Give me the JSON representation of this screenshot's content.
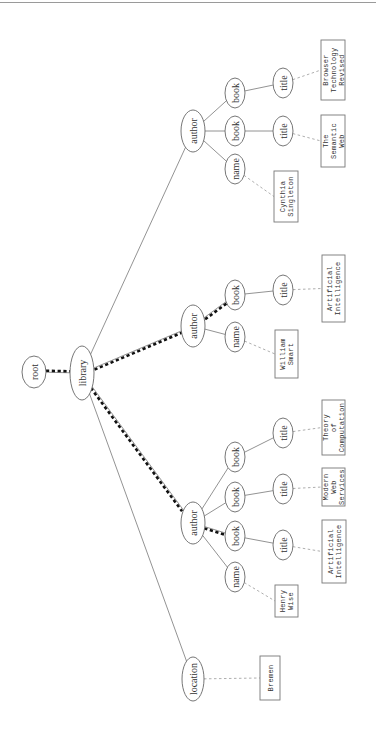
{
  "diagram": {
    "type": "xml-tree",
    "orientation": "rotated-90",
    "highlight_color": "#111111",
    "edge_color": "#777777",
    "leaf_edge_color": "#999999",
    "nodes": [
      {
        "id": "root",
        "label": "root",
        "cx": 34,
        "cy": 372,
        "rx": 12,
        "ry": 16
      },
      {
        "id": "library",
        "label": "library",
        "cx": 82,
        "cy": 373,
        "rx": 12,
        "ry": 27
      },
      {
        "id": "author3",
        "label": "author",
        "cx": 193,
        "cy": 131,
        "rx": 12,
        "ry": 21
      },
      {
        "id": "author3-name",
        "label": "name",
        "cx": 235,
        "cy": 169,
        "rx": 10,
        "ry": 15
      },
      {
        "id": "author3-book1",
        "label": "book",
        "cx": 235,
        "cy": 131,
        "rx": 10,
        "ry": 15
      },
      {
        "id": "author3-book2",
        "label": "book",
        "cx": 235,
        "cy": 93,
        "rx": 10,
        "ry": 15
      },
      {
        "id": "author3-book1-title",
        "label": "title",
        "cx": 283,
        "cy": 131,
        "rx": 10,
        "ry": 15
      },
      {
        "id": "author3-book2-title",
        "label": "title",
        "cx": 283,
        "cy": 83,
        "rx": 10,
        "ry": 15
      },
      {
        "id": "author2",
        "label": "author",
        "cx": 193,
        "cy": 326,
        "rx": 12,
        "ry": 21
      },
      {
        "id": "author2-name",
        "label": "name",
        "cx": 235,
        "cy": 337,
        "rx": 10,
        "ry": 15
      },
      {
        "id": "author2-book1",
        "label": "book",
        "cx": 235,
        "cy": 295,
        "rx": 10,
        "ry": 15
      },
      {
        "id": "author2-book1-title",
        "label": "title",
        "cx": 283,
        "cy": 290,
        "rx": 10,
        "ry": 15
      },
      {
        "id": "author1",
        "label": "author",
        "cx": 193,
        "cy": 523,
        "rx": 12,
        "ry": 21
      },
      {
        "id": "author1-name",
        "label": "name",
        "cx": 235,
        "cy": 577,
        "rx": 10,
        "ry": 15
      },
      {
        "id": "author1-book1",
        "label": "book",
        "cx": 235,
        "cy": 536,
        "rx": 10,
        "ry": 15
      },
      {
        "id": "author1-book2",
        "label": "book",
        "cx": 235,
        "cy": 497,
        "rx": 10,
        "ry": 15
      },
      {
        "id": "author1-book3",
        "label": "book",
        "cx": 235,
        "cy": 457,
        "rx": 10,
        "ry": 15
      },
      {
        "id": "author1-book1-title",
        "label": "title",
        "cx": 283,
        "cy": 545,
        "rx": 10,
        "ry": 15
      },
      {
        "id": "author1-book2-title",
        "label": "title",
        "cx": 283,
        "cy": 489,
        "rx": 10,
        "ry": 15
      },
      {
        "id": "author1-book3-title",
        "label": "title",
        "cx": 283,
        "cy": 433,
        "rx": 10,
        "ry": 15
      },
      {
        "id": "location",
        "label": "location",
        "cx": 193,
        "cy": 679,
        "rx": 11,
        "ry": 22
      }
    ],
    "leaves": [
      {
        "id": "leaf-browser",
        "lines": [
          "Browser",
          "Technology",
          "Revised"
        ],
        "x": 321,
        "y": 40,
        "w": 24,
        "h": 60,
        "parent": "author3-book2-title"
      },
      {
        "id": "leaf-semantic",
        "lines": [
          "The",
          "Semantic",
          "Web"
        ],
        "x": 321,
        "y": 115,
        "w": 24,
        "h": 52,
        "parent": "author3-book1-title"
      },
      {
        "id": "leaf-cynthia",
        "lines": [
          "Cynthia",
          "Singleton"
        ],
        "x": 274,
        "y": 171,
        "w": 24,
        "h": 51,
        "parent": "author3-name"
      },
      {
        "id": "leaf-ai2",
        "lines": [
          "Artificial",
          "Intelligence"
        ],
        "x": 322,
        "y": 255,
        "w": 23,
        "h": 67,
        "parent": "author2-book1-title"
      },
      {
        "id": "leaf-william",
        "lines": [
          "William",
          "Smart"
        ],
        "x": 275,
        "y": 330,
        "w": 23,
        "h": 48,
        "parent": "author2-name"
      },
      {
        "id": "leaf-theory",
        "lines": [
          "Theory",
          "of",
          "Computation"
        ],
        "x": 322,
        "y": 400,
        "w": 23,
        "h": 55,
        "parent": "author1-book3-title"
      },
      {
        "id": "leaf-modern",
        "lines": [
          "Modern",
          "Web",
          "Services"
        ],
        "x": 322,
        "y": 468,
        "w": 23,
        "h": 38,
        "parent": "author1-book2-title"
      },
      {
        "id": "leaf-ai1",
        "lines": [
          "Artificial",
          "Intelligence"
        ],
        "x": 322,
        "y": 520,
        "w": 24,
        "h": 63,
        "parent": "author1-book1-title"
      },
      {
        "id": "leaf-henry",
        "lines": [
          "Henry",
          "Wise"
        ],
        "x": 275,
        "y": 585,
        "w": 23,
        "h": 32,
        "parent": "author1-name"
      },
      {
        "id": "leaf-bremen",
        "lines": [
          "Bremen"
        ],
        "x": 260,
        "y": 656,
        "w": 20,
        "h": 44,
        "parent": "location"
      }
    ],
    "edges": [
      [
        "root",
        "library"
      ],
      [
        "library",
        "author3"
      ],
      [
        "library",
        "author2"
      ],
      [
        "library",
        "author1"
      ],
      [
        "library",
        "location"
      ],
      [
        "author3",
        "author3-name"
      ],
      [
        "author3",
        "author3-book1"
      ],
      [
        "author3",
        "author3-book2"
      ],
      [
        "author3-book1",
        "author3-book1-title"
      ],
      [
        "author3-book2",
        "author3-book2-title"
      ],
      [
        "author2",
        "author2-name"
      ],
      [
        "author2",
        "author2-book1"
      ],
      [
        "author2-book1",
        "author2-book1-title"
      ],
      [
        "author1",
        "author1-name"
      ],
      [
        "author1",
        "author1-book1"
      ],
      [
        "author1",
        "author1-book2"
      ],
      [
        "author1",
        "author1-book3"
      ],
      [
        "author1-book1",
        "author1-book1-title"
      ],
      [
        "author1-book2",
        "author1-book2-title"
      ],
      [
        "author1-book3",
        "author1-book3-title"
      ]
    ],
    "highlighted_path": [
      [
        "root",
        "library"
      ],
      [
        "library",
        "author2"
      ],
      [
        "author2",
        "author2-book1"
      ],
      [
        "library",
        "author1"
      ],
      [
        "author1",
        "author1-book1"
      ]
    ]
  }
}
